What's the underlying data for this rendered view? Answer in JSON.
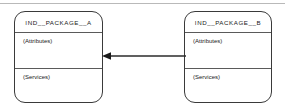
{
  "diagram": {
    "type": "package-diagram",
    "background_color": "#ffffff",
    "line_color": "#3a3a3a",
    "top_rule_color": "#b9b9b9",
    "packages": [
      {
        "id": "package-a",
        "title": "IND__PACKAGE__A",
        "attributes_label": "(Attributes)",
        "services_label": "(Services)"
      },
      {
        "id": "package-b",
        "title": "IND__PACKAGE__B",
        "attributes_label": "(Attributes)",
        "services_label": "(Services)"
      }
    ],
    "connector": {
      "from": "IND__PACKAGE__B",
      "to": "IND__PACKAGE__A",
      "direction": "left",
      "style": "solid",
      "arrowhead": "filled-triangle",
      "label": ""
    }
  }
}
